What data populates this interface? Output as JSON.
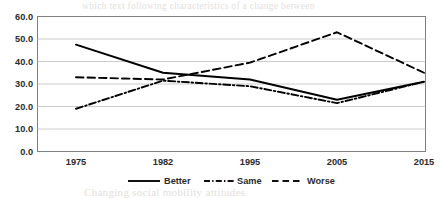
{
  "chart_data": {
    "type": "line",
    "title": "",
    "subtitle": "",
    "xlabel": "",
    "ylabel": "",
    "categories": [
      "1975",
      "1982",
      "1995",
      "2005",
      "2015"
    ],
    "ylim": [
      0,
      60
    ],
    "ytick_labels": [
      "0.0",
      "10.0",
      "20.0",
      "30.0",
      "40.0",
      "50.0",
      "60.0"
    ],
    "ytick_values": [
      0,
      10,
      20,
      30,
      40,
      50,
      60
    ],
    "grid": "horizontal",
    "legend_position": "bottom",
    "series": [
      {
        "name": "Better",
        "style": "solid",
        "color": "#000000",
        "values": [
          47.5,
          35.0,
          32.0,
          23.0,
          31.0
        ]
      },
      {
        "name": "Same",
        "style": "dash-dot",
        "color": "#000000",
        "values": [
          19.0,
          31.5,
          29.0,
          21.5,
          31.0
        ]
      },
      {
        "name": "Worse",
        "style": "dashed",
        "color": "#000000",
        "values": [
          33.0,
          32.0,
          39.5,
          53.0,
          35.0
        ]
      }
    ]
  },
  "legend": {
    "items": [
      {
        "label": "Better",
        "marker": "solid-line-marker"
      },
      {
        "label": "Same",
        "marker": "dash-dot-line-marker"
      },
      {
        "label": "Worse",
        "marker": "dashed-line-marker"
      }
    ]
  },
  "axis": {
    "y_labels": [
      "60.0",
      "50.0",
      "40.0",
      "30.0",
      "20.0",
      "10.0",
      "0.0"
    ],
    "x_labels": [
      "1975",
      "1982",
      "1995",
      "2005",
      "2015"
    ]
  },
  "background_bleed": {
    "lines": [
      "which text following characteristics of a change between",
      "in relation to better or worse has been some surveys",
      "the respondents stated that their social mobility",
      "trends over the period and the reported levels",
      "were in a better position than their parents had",
      "Changing social mobility attitudes"
    ]
  }
}
